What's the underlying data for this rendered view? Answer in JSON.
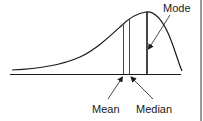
{
  "diagram": {
    "labels": {
      "mode": "Mode",
      "mean": "Mean",
      "median": "Median"
    },
    "colors": {
      "stroke": "#1a1a1a",
      "border": "#9a9a9a",
      "background": "#ffffff"
    },
    "geometry": {
      "baseline_y": 74,
      "mean_x": 123.5,
      "median_x": 129.5,
      "mode_x": 147
    }
  }
}
